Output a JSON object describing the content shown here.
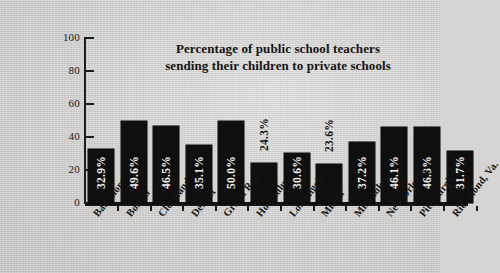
{
  "chart_data": {
    "type": "bar",
    "title": "Percentage of public school teachers sending their children to private schools",
    "title_line1": "Percentage of public school teachers",
    "title_line2": "sending their children to private schools",
    "xlabel": "",
    "ylabel": "",
    "ylim": [
      0,
      100
    ],
    "yticks": [
      0,
      20,
      40,
      60,
      80,
      100
    ],
    "ytick_labels": [
      "0",
      "20",
      "40",
      "60",
      "80",
      "100"
    ],
    "grid": false,
    "legend": false,
    "bar_color": "#100f0f",
    "background_color": "#d6d5d3",
    "text_color": "#141414",
    "categories": [
      "Baltimore",
      "Boston",
      "Cleveland",
      "Detroit",
      "Grand Rapids",
      "Honolulu",
      "Los Angeles",
      "Miami",
      "Milwaukee",
      "New Orleans",
      "Pittsburgh",
      "Richmond, Va."
    ],
    "values": [
      32.9,
      49.6,
      46.5,
      35.1,
      50.0,
      24.3,
      30.6,
      23.6,
      37.2,
      46.1,
      46.3,
      31.7
    ],
    "data_labels": [
      "32.9%",
      "49.6%",
      "46.5%",
      "35.1%",
      "50.0%",
      "24.3%",
      "30.6%",
      "23.6%",
      "37.2%",
      "46.1%",
      "46.3%",
      "31.7%"
    ],
    "label_placement": [
      "inside",
      "inside",
      "inside",
      "inside",
      "inside",
      "above",
      "inside",
      "above",
      "inside",
      "inside",
      "inside",
      "inside"
    ]
  }
}
